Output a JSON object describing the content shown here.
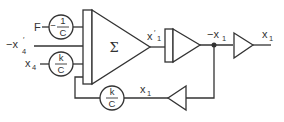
{
  "diagram": {
    "inputs": [
      {
        "label": "F",
        "coefficient": {
          "numerator": "1",
          "denominator": "C",
          "sign": "−"
        }
      },
      {
        "label": "−x",
        "superscript": "′",
        "subscript": "4"
      },
      {
        "label": "x",
        "subscript": "4",
        "coefficient": {
          "numerator": "k",
          "denominator": "C"
        }
      }
    ],
    "summer": {
      "symbol": "Σ",
      "output_label": "x",
      "output_prime": "′",
      "output_subscript": "1"
    },
    "integrator": {
      "output_label": "−x",
      "output_subscript": "1"
    },
    "inverter": {
      "output_label": "x",
      "output_subscript": "1"
    },
    "feedback": {
      "label": "x",
      "subscript": "1",
      "coefficient": {
        "numerator": "k",
        "denominator": "C"
      }
    },
    "colors": {
      "stroke": "#333333",
      "background": "#ffffff"
    }
  }
}
